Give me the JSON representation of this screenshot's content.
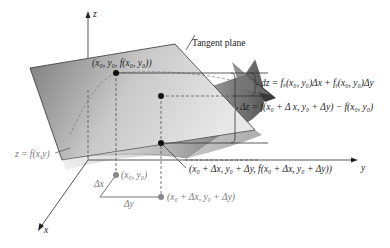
{
  "figure": {
    "type": "3d-surface-diagram",
    "title": "",
    "axes": {
      "x": "x",
      "y": "y",
      "z": "z"
    },
    "labels": {
      "tangent_plane": "Tangent plane",
      "surface": "z = f(x,y)",
      "point_on_surface_at_base": "(x₀, y₀, f(x₀, y₀))",
      "point_on_surface_shifted": "(x₀ + Δx, y₀ + Δy, f(x₀ + Δx, y₀ + Δy))",
      "base_point": "(x₀, y₀)",
      "shifted_base_point": "(x₀ + Δx, y₀ + Δy)",
      "delta_x": "Δx",
      "delta_y": "Δy",
      "dz_formula": "dz = fₓ(x₀, y₀)Δx + fᵧ(x₀, y₀)Δy",
      "delta_z_formula": "Δz = f(x₀ + Δ x, y₀ + Δy) − f(x₀, y₀)"
    },
    "colors": {
      "plane_dark": "#6e6e6e",
      "plane_light": "#f2f2f2",
      "surface_dark": "#555555",
      "surface_light": "#f5f5f5",
      "axis": "#444444",
      "base_points": "#888888",
      "surface_points": "#111111"
    }
  }
}
